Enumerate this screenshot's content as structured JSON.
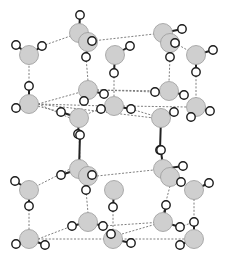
{
  "diagram": {
    "title": "",
    "colors": {
      "oxygen_fill": "#cfcfcf",
      "oxygen_stroke": "#9a9a9a",
      "hydrogen_fill": "#ffffff",
      "hydrogen_stroke": "#1a1a1a",
      "hbond": "#707070",
      "background": "#ffffff"
    },
    "oxygen_radius": 9.5,
    "hydrogen_radius": 4.2,
    "molecules": [
      {
        "id": "w1",
        "o": [
          79,
          33
        ],
        "h": [
          [
            80,
            15
          ],
          [
            92,
            41
          ]
        ]
      },
      {
        "id": "w2",
        "o": [
          88,
          42
        ],
        "h": [
          [
            92,
            41
          ],
          [
            86,
            57
          ]
        ]
      },
      {
        "id": "w3",
        "o": [
          29,
          55
        ],
        "h": [
          [
            16,
            45
          ],
          [
            42,
            46
          ]
        ]
      },
      {
        "id": "w4",
        "o": [
          115,
          55
        ],
        "h": [
          [
            130,
            46
          ],
          [
            114,
            73
          ]
        ]
      },
      {
        "id": "w5",
        "o": [
          163,
          33
        ],
        "h": [
          [
            182,
            29
          ],
          [
            175,
            43
          ]
        ]
      },
      {
        "id": "w6",
        "o": [
          170,
          43
        ],
        "h": [
          [
            175,
            43
          ],
          [
            170,
            57
          ]
        ]
      },
      {
        "id": "w7",
        "o": [
          196,
          55
        ],
        "h": [
          [
            213,
            50
          ],
          [
            196,
            72
          ]
        ]
      },
      {
        "id": "w8",
        "o": [
          29,
          104
        ],
        "h": [
          [
            29,
            86
          ],
          [
            16,
            108
          ]
        ]
      },
      {
        "id": "w9",
        "o": [
          88,
          90
        ],
        "h": [
          [
            104,
            94
          ],
          [
            84,
            101
          ]
        ]
      },
      {
        "id": "w10",
        "o": [
          79,
          118
        ],
        "h": [
          [
            61,
            112
          ],
          [
            78,
            134
          ]
        ]
      },
      {
        "id": "w11",
        "o": [
          114,
          106
        ],
        "h": [
          [
            101,
            109
          ],
          [
            131,
            109
          ]
        ]
      },
      {
        "id": "w12",
        "o": [
          169,
          91
        ],
        "h": [
          [
            155,
            92
          ],
          [
            184,
            95
          ]
        ]
      },
      {
        "id": "w13",
        "o": [
          161,
          118
        ],
        "h": [
          [
            174,
            112
          ],
          [
            160,
            150
          ]
        ]
      },
      {
        "id": "w14",
        "o": [
          196,
          107
        ],
        "h": [
          [
            210,
            111
          ],
          [
            191,
            117
          ]
        ]
      },
      {
        "id": "w15",
        "o": [
          79,
          169
        ],
        "h": [
          [
            80,
            135
          ],
          [
            61,
            175
          ]
        ]
      },
      {
        "id": "w16",
        "o": [
          88,
          176
        ],
        "h": [
          [
            92,
            175
          ],
          [
            86,
            190
          ]
        ]
      },
      {
        "id": "w17",
        "o": [
          29,
          190
        ],
        "h": [
          [
            15,
            181
          ],
          [
            29,
            206
          ]
        ]
      },
      {
        "id": "w18",
        "o": [
          114,
          190
        ],
        "h": [
          [
            113,
            207
          ]
        ]
      },
      {
        "id": "w19",
        "o": [
          163,
          169
        ],
        "h": [
          [
            161,
            150
          ],
          [
            183,
            166
          ]
        ]
      },
      {
        "id": "w20",
        "o": [
          170,
          177
        ],
        "h": [
          [
            181,
            182
          ]
        ]
      },
      {
        "id": "w21",
        "o": [
          194,
          190
        ],
        "h": [
          [
            209,
            183
          ]
        ]
      },
      {
        "id": "w22",
        "o": [
          29,
          239
        ],
        "h": [
          [
            16,
            244
          ],
          [
            45,
            245
          ]
        ]
      },
      {
        "id": "w23",
        "o": [
          88,
          222
        ],
        "h": [
          [
            72,
            226
          ],
          [
            103,
            226
          ]
        ]
      },
      {
        "id": "w24",
        "o": [
          113,
          239
        ],
        "h": [
          [
            111,
            234
          ],
          [
            131,
            243
          ]
        ]
      },
      {
        "id": "w25",
        "o": [
          163,
          222
        ],
        "h": [
          [
            166,
            205
          ],
          [
            180,
            227
          ]
        ]
      },
      {
        "id": "w26",
        "o": [
          194,
          239
        ],
        "h": [
          [
            180,
            245
          ],
          [
            194,
            222
          ]
        ]
      }
    ],
    "hydrogen_bonds": [
      [
        [
          42,
          46
        ],
        [
          79,
          33
        ]
      ],
      [
        [
          79,
          33
        ],
        [
          88,
          42
        ]
      ],
      [
        [
          92,
          41
        ],
        [
          163,
          33
        ]
      ],
      [
        [
          175,
          43
        ],
        [
          196,
          55
        ]
      ],
      [
        [
          29,
          55
        ],
        [
          29,
          86
        ]
      ],
      [
        [
          86,
          57
        ],
        [
          88,
          81
        ]
      ],
      [
        [
          114,
          73
        ],
        [
          114,
          96
        ]
      ],
      [
        [
          170,
          57
        ],
        [
          169,
          82
        ]
      ],
      [
        [
          196,
          72
        ],
        [
          196,
          98
        ]
      ],
      [
        [
          38,
          104
        ],
        [
          88,
          90
        ]
      ],
      [
        [
          38,
          104
        ],
        [
          70,
          118
        ]
      ],
      [
        [
          38,
          104
        ],
        [
          105,
          106
        ]
      ],
      [
        [
          38,
          104
        ],
        [
          154,
          118
        ]
      ],
      [
        [
          97,
          90
        ],
        [
          155,
          92
        ]
      ],
      [
        [
          97,
          90
        ],
        [
          169,
          91
        ]
      ],
      [
        [
          123,
          106
        ],
        [
          187,
          107
        ]
      ],
      [
        [
          131,
          109
        ],
        [
          161,
          118
        ]
      ],
      [
        [
          79,
          118
        ],
        [
          105,
          106
        ]
      ],
      [
        [
          79,
          134
        ],
        [
          80,
          160
        ]
      ],
      [
        [
          160,
          150
        ],
        [
          163,
          160
        ]
      ],
      [
        [
          61,
          112
        ],
        [
          29,
          104
        ]
      ],
      [
        [
          29,
          190
        ],
        [
          70,
          169
        ]
      ],
      [
        [
          97,
          176
        ],
        [
          163,
          169
        ]
      ],
      [
        [
          29,
          206
        ],
        [
          29,
          230
        ]
      ],
      [
        [
          86,
          190
        ],
        [
          88,
          213
        ]
      ],
      [
        [
          113,
          207
        ],
        [
          113,
          230
        ]
      ],
      [
        [
          170,
          186
        ],
        [
          163,
          213
        ]
      ],
      [
        [
          194,
          199
        ],
        [
          194,
          222
        ]
      ],
      [
        [
          38,
          239
        ],
        [
          72,
          226
        ]
      ],
      [
        [
          38,
          239
        ],
        [
          113,
          239
        ]
      ],
      [
        [
          103,
          226
        ],
        [
          163,
          222
        ]
      ],
      [
        [
          121,
          239
        ],
        [
          194,
          239
        ]
      ],
      [
        [
          122,
          234
        ],
        [
          163,
          222
        ]
      ],
      [
        [
          180,
          227
        ],
        [
          194,
          222
        ]
      ]
    ]
  }
}
